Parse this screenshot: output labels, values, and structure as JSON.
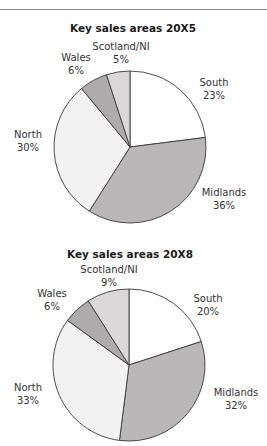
{
  "chart_data": [
    {
      "type": "pie",
      "title": "Key sales areas 20X5",
      "categories": [
        "South",
        "Midlands",
        "North",
        "Wales",
        "Scotland/NI"
      ],
      "values": [
        23,
        36,
        30,
        6,
        5
      ],
      "value_labels": [
        "23%",
        "36%",
        "30%",
        "6%",
        "5%"
      ],
      "colors": [
        "#ffffff",
        "#b9b7b7",
        "#f3f2f2",
        "#adabab",
        "#dad8d8"
      ],
      "start_angle": "12 o'clock, clockwise",
      "layout": {
        "center": [
          130,
          147
        ],
        "radius": 76,
        "title_pos": [
          133,
          32
        ],
        "label_pos": [
          [
            214,
            86
          ],
          [
            224,
            196
          ],
          [
            28,
            138
          ],
          [
            76,
            61
          ],
          [
            121,
            50
          ]
        ]
      }
    },
    {
      "type": "pie",
      "title": "Key sales areas 20X8",
      "categories": [
        "South",
        "Midlands",
        "North",
        "Wales",
        "Scotland/NI"
      ],
      "values": [
        20,
        32,
        33,
        6,
        9
      ],
      "value_labels": [
        "20%",
        "32%",
        "33%",
        "6%",
        "9%"
      ],
      "colors": [
        "#ffffff",
        "#b9b7b7",
        "#f3f2f2",
        "#adabab",
        "#dad8d8"
      ],
      "start_angle": "12 o'clock, clockwise",
      "layout": {
        "center": [
          129,
          365
        ],
        "radius": 76,
        "title_pos": [
          130,
          258
        ],
        "label_pos": [
          [
            208,
            302
          ],
          [
            236,
            396
          ],
          [
            28,
            391
          ],
          [
            52,
            297
          ],
          [
            109,
            273
          ]
        ]
      }
    }
  ]
}
